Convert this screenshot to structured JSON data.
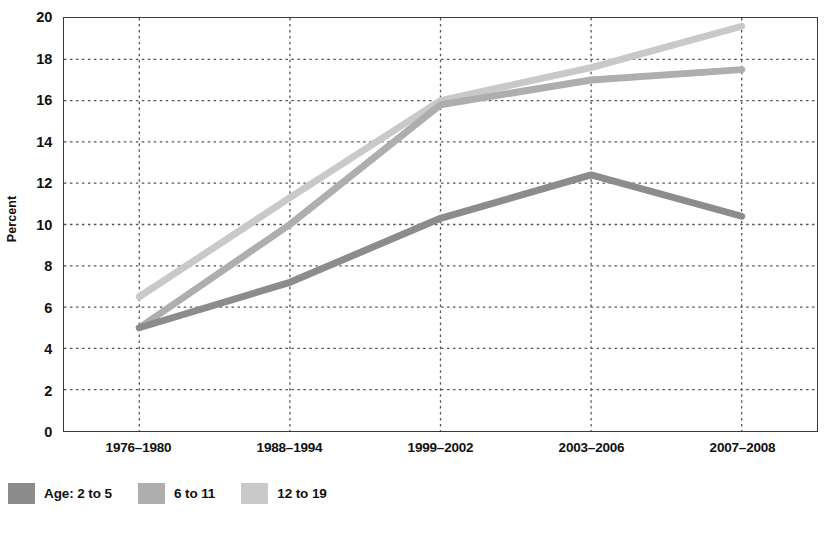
{
  "chart_data": {
    "type": "line",
    "title": "",
    "xlabel": "",
    "ylabel": "Percent",
    "categories": [
      "1976–1980",
      "1988–1994",
      "1999–2002",
      "2003–2006",
      "2007–2008"
    ],
    "ylim": [
      0,
      20
    ],
    "ytick_step": 2,
    "yticks": [
      "20",
      "18",
      "16",
      "14",
      "12",
      "10",
      "8",
      "6",
      "4",
      "2",
      "0"
    ],
    "grid": "dotted-horizontal-and-vertical",
    "legend_position": "below-axes-left",
    "legend_prefix": "Age:",
    "series": [
      {
        "name": "2 to 5",
        "legend_label": "Age: 2 to 5",
        "color": "#8c8c8c",
        "values": [
          5.0,
          7.2,
          10.3,
          12.4,
          10.4
        ]
      },
      {
        "name": "6 to 11",
        "legend_label": "6 to 11",
        "color": "#aeaeae",
        "values": [
          5.0,
          10.0,
          15.8,
          17.0,
          17.5
        ]
      },
      {
        "name": "12 to 19",
        "legend_label": "12 to 19",
        "color": "#c9c9c9",
        "values": [
          6.5,
          11.3,
          16.0,
          17.6,
          19.6
        ]
      }
    ]
  },
  "colors": {
    "axis": "#3a3a3a",
    "grid": "#555555",
    "text": "#111111",
    "background": "#ffffff"
  }
}
